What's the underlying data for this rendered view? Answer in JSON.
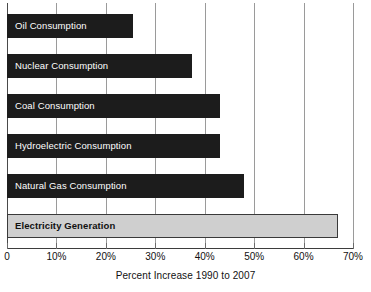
{
  "chart_data": {
    "type": "bar",
    "orientation": "horizontal",
    "title": "",
    "xlabel": "Percent Increase 1990 to 2007",
    "ylabel": "",
    "xlim": [
      0,
      70
    ],
    "grid": true,
    "legend": "none",
    "categories": [
      "Oil Consumption",
      "Nuclear Consumption",
      "Coal Consumption",
      "Hydroelectric Consumption",
      "Natural Gas Consumption",
      "Electricity Generation"
    ],
    "values": [
      25.5,
      37.5,
      43,
      43,
      48,
      67
    ],
    "tick_labels": [
      "0",
      "10%",
      "20%",
      "30%",
      "40%",
      "50%",
      "60%",
      "70%"
    ],
    "tick_values": [
      0,
      10,
      20,
      30,
      40,
      50,
      60,
      70
    ],
    "bars": [
      {
        "label": "Oil Consumption",
        "value": 25.5,
        "style": "dark"
      },
      {
        "label": "Nuclear Consumption",
        "value": 37.5,
        "style": "dark"
      },
      {
        "label": "Coal Consumption",
        "value": 43,
        "style": "dark"
      },
      {
        "label": "Hydroelectric Consumption",
        "value": 43,
        "style": "dark"
      },
      {
        "label": "Natural Gas Consumption",
        "value": 48,
        "style": "dark"
      },
      {
        "label": "Electricity Generation",
        "value": 67,
        "style": "light"
      }
    ],
    "colors": {
      "bar_dark": "#1c1c1c",
      "bar_light": "#cfcfcf",
      "bar_light_border": "#3a3a3a",
      "gridline": "#9a9a9a",
      "axis": "#3d3d3d",
      "label_on_dark": "#ffffff",
      "label_on_light": "#111111",
      "background": "#ffffff"
    }
  }
}
